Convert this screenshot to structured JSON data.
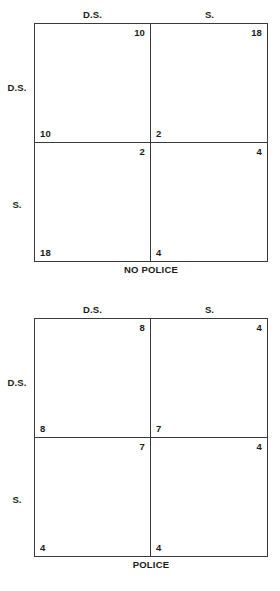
{
  "figure": {
    "type": "payoff-matrix-pair",
    "matrices": [
      {
        "caption": "NO POLICE",
        "row_player_label": "",
        "col_player_label": "",
        "col_headers": [
          "D.S.",
          "S."
        ],
        "row_headers": [
          "D.S.",
          "S."
        ],
        "cells": [
          [
            {
              "row_payoff": "10",
              "col_payoff": "10"
            },
            {
              "row_payoff": "2",
              "col_payoff": "18"
            }
          ],
          [
            {
              "row_payoff": "18",
              "col_payoff": "2"
            },
            {
              "row_payoff": "4",
              "col_payoff": "4"
            }
          ]
        ]
      },
      {
        "caption": "POLICE",
        "row_player_label": "",
        "col_player_label": "",
        "col_headers": [
          "D.S.",
          "S."
        ],
        "row_headers": [
          "D.S.",
          "S."
        ],
        "cells": [
          [
            {
              "row_payoff": "8",
              "col_payoff": "8"
            },
            {
              "row_payoff": "7",
              "col_payoff": "4"
            }
          ],
          [
            {
              "row_payoff": "4",
              "col_payoff": "7"
            },
            {
              "row_payoff": "4",
              "col_payoff": "4"
            }
          ]
        ]
      }
    ]
  },
  "chart_data": {
    "type": "table",
    "title": "",
    "subtitle": "",
    "panels": [
      {
        "title": "NO POLICE",
        "columns": [
          "D.S.",
          "S."
        ],
        "rows": [
          "D.S.",
          "S."
        ],
        "values": [
          [
            [
              10,
              10
            ],
            [
              2,
              18
            ]
          ],
          [
            [
              18,
              2
            ],
            [
              4,
              4
            ]
          ]
        ],
        "value_format": "[row_player_payoff, column_player_payoff]"
      },
      {
        "title": "POLICE",
        "columns": [
          "D.S.",
          "S."
        ],
        "rows": [
          "D.S.",
          "S."
        ],
        "values": [
          [
            [
              8,
              8
            ],
            [
              7,
              4
            ]
          ],
          [
            [
              4,
              7
            ],
            [
              4,
              4
            ]
          ]
        ],
        "value_format": "[row_player_payoff, column_player_payoff]"
      }
    ],
    "xlabel": "",
    "ylabel": "",
    "grid": true,
    "legend": null,
    "colors": {
      "line": "#3a3a3a",
      "text": "#1a1a1a",
      "background": "#ffffff"
    }
  }
}
